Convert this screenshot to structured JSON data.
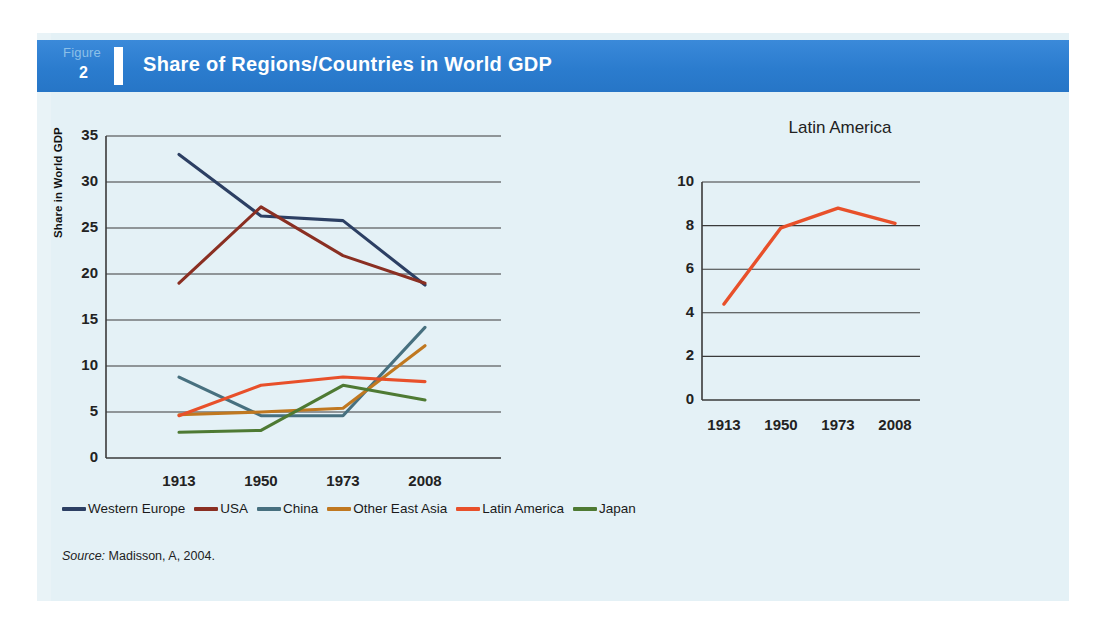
{
  "figure": {
    "label": "Figure",
    "number": "2",
    "title": "Share of Regions/Countries in World GDP",
    "banner_color": "#2e7fd1",
    "panel_color": "#e4f1f6"
  },
  "source": {
    "prefix": "Source:",
    "text": "Madisson, A, 2004."
  },
  "legend": {
    "items": [
      {
        "label": "Western Europe",
        "color": "#2c3f63"
      },
      {
        "label": "USA",
        "color": "#8a2f22"
      },
      {
        "label": "China",
        "color": "#47707f"
      },
      {
        "label": "Other East  Asia",
        "color": "#c07820"
      },
      {
        "label": "Latin America",
        "color": "#e8502a"
      },
      {
        "label": "Japan",
        "color": "#4e7a33"
      }
    ]
  },
  "chart_data": [
    {
      "id": "main",
      "type": "line",
      "title": "",
      "xlabel": "",
      "ylabel": "Share in World GDP",
      "categories": [
        "1913",
        "1950",
        "1973",
        "2008"
      ],
      "ylim": [
        0,
        35
      ],
      "yticks": [
        0,
        5,
        10,
        15,
        20,
        25,
        30,
        35
      ],
      "grid": true,
      "legend_position": "bottom",
      "series": [
        {
          "name": "Western Europe",
          "color": "#2c3f63",
          "values": [
            33.0,
            26.3,
            25.8,
            18.8
          ]
        },
        {
          "name": "USA",
          "color": "#8a2f22",
          "values": [
            19.0,
            27.3,
            22.0,
            19.0
          ]
        },
        {
          "name": "China",
          "color": "#47707f",
          "values": [
            8.8,
            4.6,
            4.6,
            14.2
          ]
        },
        {
          "name": "Other East  Asia",
          "color": "#c07820",
          "values": [
            4.7,
            5.0,
            5.4,
            12.2
          ]
        },
        {
          "name": "Latin America",
          "color": "#e8502a",
          "values": [
            4.6,
            7.9,
            8.8,
            8.3
          ]
        },
        {
          "name": "Japan",
          "color": "#4e7a33",
          "values": [
            2.8,
            3.0,
            7.9,
            6.3
          ]
        }
      ]
    },
    {
      "id": "latin-america",
      "type": "line",
      "title": "Latin America",
      "xlabel": "",
      "ylabel": "",
      "categories": [
        "1913",
        "1950",
        "1973",
        "2008"
      ],
      "ylim": [
        0,
        10
      ],
      "yticks": [
        0,
        2,
        4,
        6,
        8,
        10
      ],
      "grid": true,
      "legend_position": "none",
      "series": [
        {
          "name": "Latin America",
          "color": "#e8502a",
          "values": [
            4.4,
            7.9,
            8.8,
            8.1
          ]
        }
      ]
    }
  ]
}
